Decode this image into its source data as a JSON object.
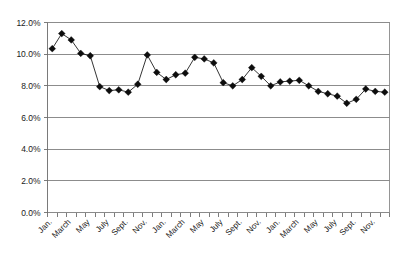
{
  "chart_data": {
    "type": "line",
    "title": "",
    "subtitle": "",
    "xlabel": "",
    "ylabel": "",
    "grid": true,
    "legend": "none",
    "ylim": [
      0,
      12
    ],
    "ytick_labels": [
      "0.0%",
      "2.0%",
      "4.0%",
      "6.0%",
      "8.0%",
      "10.0%",
      "12.0%"
    ],
    "ytick_values": [
      0,
      2,
      4,
      6,
      8,
      10,
      12
    ],
    "x_tick_count": 36,
    "xtick_labels": [
      "Jan.",
      "",
      "March",
      "",
      "May",
      "",
      "July",
      "",
      "Sept.",
      "",
      "Nov.",
      "",
      "Jan.",
      "",
      "March",
      "",
      "May",
      "",
      "July",
      "",
      "Sept.",
      "",
      "Nov.",
      "",
      "Jan.",
      "",
      "March",
      "",
      "May",
      "",
      "July",
      "",
      "Sept.",
      "",
      "Nov.",
      ""
    ],
    "categories": [
      "Jan.",
      "Feb.",
      "March",
      "April",
      "May",
      "June",
      "July",
      "Aug.",
      "Sept.",
      "Oct.",
      "Nov.",
      "Dec.",
      "Jan.",
      "Feb.",
      "March",
      "April",
      "May",
      "June",
      "July",
      "Aug.",
      "Sept.",
      "Oct.",
      "Nov.",
      "Dec.",
      "Jan.",
      "Feb.",
      "March",
      "April",
      "May",
      "June",
      "July",
      "Aug.",
      "Sept.",
      "Oct.",
      "Nov.",
      "Dec."
    ],
    "series": [
      {
        "name": "rate",
        "marker": "diamond",
        "color": "#0d0d0d",
        "values": [
          10.35,
          11.3,
          10.9,
          10.05,
          9.9,
          7.95,
          7.7,
          7.75,
          7.6,
          8.1,
          9.95,
          8.85,
          8.4,
          8.7,
          8.8,
          9.8,
          9.7,
          9.45,
          8.2,
          8.0,
          8.4,
          9.15,
          8.6,
          8.0,
          8.25,
          8.3,
          8.35,
          8.0,
          7.65,
          7.5,
          7.35,
          6.9,
          7.15,
          7.8,
          7.65,
          7.6
        ]
      }
    ],
    "colors": {
      "line": "#111111",
      "marker": "#0d0d0d",
      "grid": "#808080",
      "axis": "#7a7a7a",
      "background": "#ffffff"
    }
  }
}
